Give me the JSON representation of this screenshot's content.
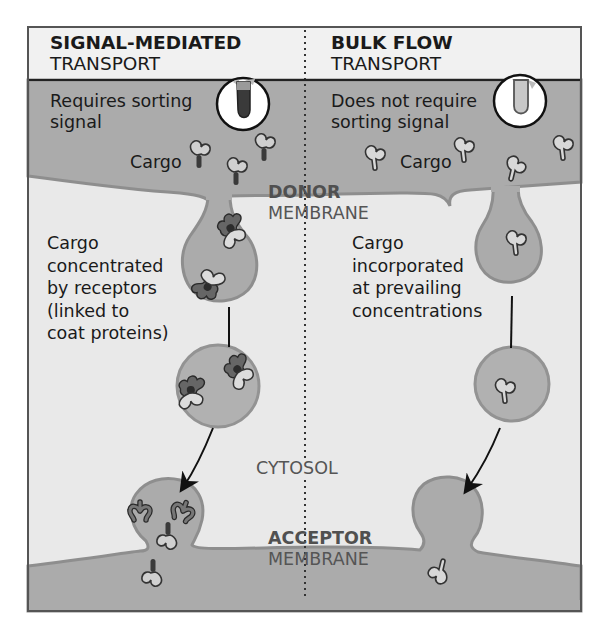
{
  "figure": {
    "colors": {
      "frame": "#555555",
      "header_bg": "#f0f0f0",
      "membrane_fill": "#ababab",
      "membrane_edge": "#8e8e8e",
      "cytosol": "#e9e9e9",
      "vesicle_fill": "#b1b1b1",
      "vesicle_edge": "#939393",
      "signal_dark": "#3a3a3a",
      "receptor_dark": "#5a5a5a",
      "text": "#1a1a1a",
      "center_text": "#555555"
    },
    "left_panel": {
      "title_bold": "SIGNAL-MEDIATED",
      "title_regular": "TRANSPORT",
      "requirement": [
        "Requires sorting",
        "signal"
      ],
      "cargo_label": "Cargo",
      "vesicle_caption": [
        "Cargo",
        "concentrated",
        "by receptors",
        "(linked to",
        "coat proteins)"
      ],
      "inset_icon": "cargo-with-sorting-signal-icon"
    },
    "right_panel": {
      "title_bold": "BULK FLOW",
      "title_regular": "TRANSPORT",
      "requirement": [
        "Does not require",
        "sorting signal"
      ],
      "cargo_label": "Cargo",
      "vesicle_caption": [
        "Cargo",
        "incorporated",
        "at prevailing",
        "concentrations"
      ],
      "inset_icon": "cargo-without-sorting-signal-icon"
    },
    "center": {
      "donor_bold": "DONOR",
      "donor_regular": "MEMBRANE",
      "cytosol": "CYTOSOL",
      "acceptor_bold": "ACCEPTOR",
      "acceptor_regular": "MEMBRANE"
    }
  }
}
